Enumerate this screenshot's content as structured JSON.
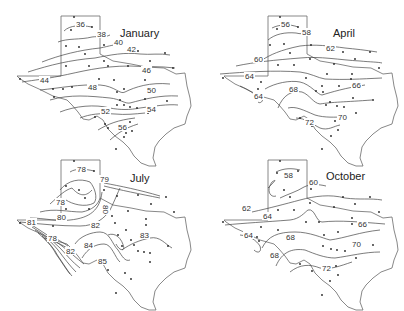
{
  "chart_data": [
    {
      "type": "contour_map",
      "title": "January",
      "region": "Texas",
      "variable": "mean temperature isotherms (°F)",
      "contour_labels": [
        36,
        38,
        40,
        42,
        44,
        46,
        48,
        50,
        52,
        54,
        56
      ],
      "trend": "increases from north/northwest panhandle toward southeast coast"
    },
    {
      "type": "contour_map",
      "title": "April",
      "region": "Texas",
      "variable": "mean temperature isotherms (°F)",
      "contour_labels": [
        56,
        58,
        60,
        62,
        64,
        64,
        66,
        68,
        70,
        72
      ],
      "trend": "increases from panhandle toward south"
    },
    {
      "type": "contour_map",
      "title": "July",
      "region": "Texas",
      "variable": "mean temperature isotherms (°F)",
      "contour_labels": [
        78,
        79,
        78,
        80,
        80,
        81,
        82,
        78,
        82,
        83,
        84,
        85
      ],
      "trend": "coolest in panhandle and far-west mountains, warmest in south-central"
    },
    {
      "type": "contour_map",
      "title": "October",
      "region": "Texas",
      "variable": "mean temperature isotherms (°F)",
      "contour_labels": [
        58,
        60,
        62,
        64,
        64,
        66,
        68,
        68,
        70,
        72
      ],
      "trend": "increases from panhandle toward southeast coast"
    }
  ],
  "panels": {
    "january": {
      "title": "January",
      "labels": [
        {
          "t": "36",
          "x": 76,
          "y": 27
        },
        {
          "t": "38",
          "x": 97,
          "y": 37
        },
        {
          "t": "40",
          "x": 114,
          "y": 45
        },
        {
          "t": "42",
          "x": 127,
          "y": 52
        },
        {
          "t": "44",
          "x": 40,
          "y": 83
        },
        {
          "t": "46",
          "x": 142,
          "y": 73
        },
        {
          "t": "48",
          "x": 88,
          "y": 90
        },
        {
          "t": "50",
          "x": 147,
          "y": 93
        },
        {
          "t": "52",
          "x": 101,
          "y": 114
        },
        {
          "t": "54",
          "x": 147,
          "y": 112
        },
        {
          "t": "56",
          "x": 118,
          "y": 130
        }
      ]
    },
    "april": {
      "title": "April",
      "labels": [
        {
          "t": "56",
          "x": 281,
          "y": 27
        },
        {
          "t": "58",
          "x": 302,
          "y": 35
        },
        {
          "t": "60",
          "x": 254,
          "y": 62
        },
        {
          "t": "62",
          "x": 326,
          "y": 51
        },
        {
          "t": "64",
          "x": 245,
          "y": 79
        },
        {
          "t": "64",
          "x": 254,
          "y": 99
        },
        {
          "t": "66",
          "x": 352,
          "y": 88
        },
        {
          "t": "68",
          "x": 289,
          "y": 92
        },
        {
          "t": "70",
          "x": 338,
          "y": 120
        },
        {
          "t": "72",
          "x": 305,
          "y": 125
        }
      ]
    },
    "july": {
      "title": "July",
      "labels": [
        {
          "t": "78",
          "x": 77,
          "y": 172
        },
        {
          "t": "79",
          "x": 100,
          "y": 182
        },
        {
          "t": "78",
          "x": 56,
          "y": 205
        },
        {
          "t": "80",
          "x": 103,
          "y": 205,
          "rot": 90
        },
        {
          "t": "80",
          "x": 57,
          "y": 220
        },
        {
          "t": "81",
          "x": 27,
          "y": 225
        },
        {
          "t": "82",
          "x": 91,
          "y": 228
        },
        {
          "t": "78",
          "x": 48,
          "y": 241
        },
        {
          "t": "83",
          "x": 140,
          "y": 238
        },
        {
          "t": "84",
          "x": 84,
          "y": 248
        },
        {
          "t": "82",
          "x": 66,
          "y": 254
        },
        {
          "t": "85",
          "x": 98,
          "y": 264
        }
      ]
    },
    "october": {
      "title": "October",
      "labels": [
        {
          "t": "58",
          "x": 284,
          "y": 178
        },
        {
          "t": "60",
          "x": 309,
          "y": 185
        },
        {
          "t": "62",
          "x": 242,
          "y": 211
        },
        {
          "t": "64",
          "x": 263,
          "y": 219
        },
        {
          "t": "64",
          "x": 244,
          "y": 238
        },
        {
          "t": "66",
          "x": 358,
          "y": 227
        },
        {
          "t": "68",
          "x": 286,
          "y": 240
        },
        {
          "t": "68",
          "x": 270,
          "y": 258
        },
        {
          "t": "70",
          "x": 352,
          "y": 247
        },
        {
          "t": "72",
          "x": 322,
          "y": 271
        }
      ]
    }
  }
}
